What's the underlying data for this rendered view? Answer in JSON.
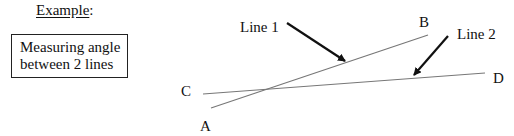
{
  "heading": {
    "text": "Example",
    "suffix": ":"
  },
  "caption": {
    "line1": "Measuring angle",
    "line2": "between 2 lines"
  },
  "diagram": {
    "points": {
      "A": {
        "label": "A",
        "x": 203,
        "y": 108
      },
      "B": {
        "label": "B",
        "x": 428,
        "y": 35
      },
      "C": {
        "label": "C",
        "x": 205,
        "y": 94
      },
      "D": {
        "label": "D",
        "x": 485,
        "y": 73
      }
    },
    "callouts": [
      {
        "label": "Line 1",
        "target_line": "A-B"
      },
      {
        "label": "Line 2",
        "target_line": "C-D"
      }
    ],
    "line_color": "#777777",
    "arrow_color": "#111111"
  }
}
